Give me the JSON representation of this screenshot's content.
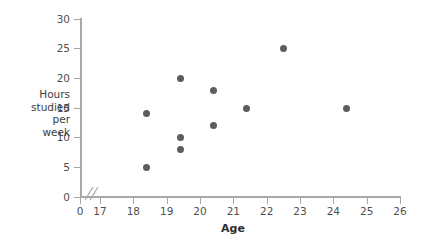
{
  "chart_data": {
    "type": "scatter",
    "title": "",
    "xlabel": "Age",
    "ylabel": "Hours studied per week",
    "ylabel_lines": [
      "Hours",
      "studied",
      "per",
      "week"
    ],
    "xlim": [
      17,
      26
    ],
    "ylim": [
      0,
      30
    ],
    "x_ticks": [
      0,
      17,
      18,
      19,
      20,
      21,
      22,
      23,
      24,
      25,
      26
    ],
    "y_ticks": [
      0,
      5,
      10,
      15,
      20,
      25,
      30
    ],
    "x_tick_labels": [
      "0",
      "17",
      "18",
      "19",
      "20",
      "21",
      "22",
      "23",
      "24",
      "25",
      "26"
    ],
    "y_tick_labels": [
      "0",
      "5",
      "10",
      "15",
      "20",
      "25",
      "30"
    ],
    "axis_break": true,
    "axis_break_between": [
      0,
      17
    ],
    "grid": false,
    "legend": null,
    "marker_color": "#5d5d5d",
    "axis_color": "#a8a8a8",
    "points": [
      {
        "x": 18.4,
        "y": 14
      },
      {
        "x": 18.4,
        "y": 5
      },
      {
        "x": 19.4,
        "y": 20
      },
      {
        "x": 19.4,
        "y": 10
      },
      {
        "x": 19.4,
        "y": 8
      },
      {
        "x": 20.4,
        "y": 18
      },
      {
        "x": 20.4,
        "y": 12
      },
      {
        "x": 21.4,
        "y": 15
      },
      {
        "x": 22.5,
        "y": 25
      },
      {
        "x": 24.4,
        "y": 15
      }
    ]
  }
}
